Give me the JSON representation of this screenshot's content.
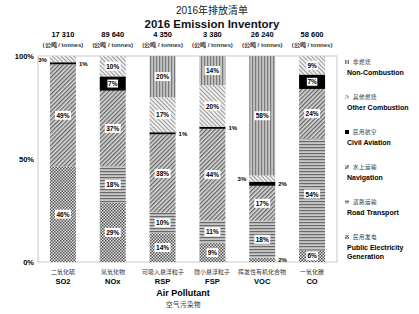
{
  "chart_data": {
    "type": "bar",
    "stacked": true,
    "normalized": true,
    "title_cn": "2016年排放清单",
    "title": "2016 Emission Inventory",
    "xlabel": "Air Pollutant",
    "xlabel_cn": "空气污染物",
    "ylabel": "",
    "ylim": [
      0,
      100
    ],
    "y_ticks": [
      "0%",
      "50%",
      "100%"
    ],
    "grid": false,
    "legend_position": "right",
    "unit_label_cn": "公吨",
    "unit_label": "tonnes",
    "categories": [
      {
        "code": "SO2",
        "cn": "二氧化硫",
        "total": "17 310"
      },
      {
        "code": "NOx",
        "cn": "氮氧化物",
        "total": "89 640"
      },
      {
        "code": "RSP",
        "cn": "可吸入悬浮粒子",
        "total": "4 350"
      },
      {
        "code": "FSP",
        "cn": "微小悬浮粒子",
        "total": "3 380"
      },
      {
        "code": "VOC",
        "cn": "挥发性有机化合物",
        "total": "26 240"
      },
      {
        "code": "CO",
        "cn": "一氧化碳",
        "total": "58 600"
      }
    ],
    "series": [
      {
        "name": "Public Electricity Generation",
        "cn": "民用发电",
        "values": [
          46,
          29,
          14,
          9,
          2,
          6
        ]
      },
      {
        "name": "Road Transport",
        "cn": "道路运输",
        "values": [
          0,
          18,
          10,
          11,
          18,
          54
        ]
      },
      {
        "name": "Navigation",
        "cn": "水上运输",
        "values": [
          49,
          37,
          38,
          44,
          17,
          24
        ]
      },
      {
        "name": "Civil Aviation",
        "cn": "民用航空",
        "values": [
          1,
          7,
          1,
          1,
          2,
          7
        ]
      },
      {
        "name": "Other Combustion",
        "cn": "其他燃烧",
        "values": [
          3,
          10,
          17,
          20,
          3,
          9
        ]
      },
      {
        "name": "Non-Combustion",
        "cn": "非燃烧",
        "values": [
          0,
          0,
          20,
          14,
          58,
          0
        ]
      }
    ],
    "legend": [
      {
        "name": "Non-Combustion",
        "cn": "非燃烧"
      },
      {
        "name": "Other Combustion",
        "cn": "其他燃烧"
      },
      {
        "name": "Civil Aviation",
        "cn": "民用航空"
      },
      {
        "name": "Navigation",
        "cn": "水上运输"
      },
      {
        "name": "Road Transport",
        "cn": "道路运输"
      },
      {
        "name": "Public Electricity",
        "name2": "Generation",
        "cn": "民用发电"
      }
    ]
  }
}
